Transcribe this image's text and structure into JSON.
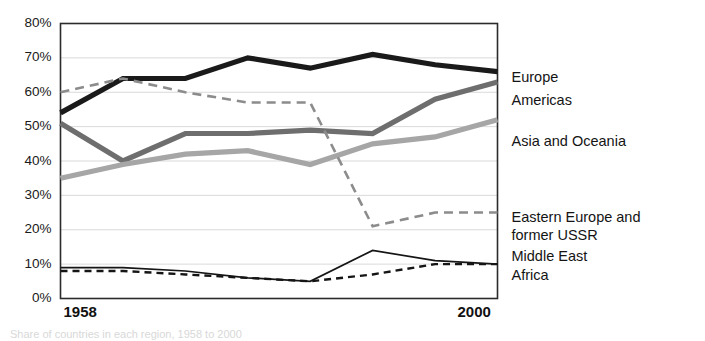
{
  "chart_data": {
    "type": "line",
    "title": "",
    "xlabel": "",
    "ylabel": "",
    "grid": true,
    "legend_position": "right",
    "ylim": [
      0,
      80
    ],
    "ytick_labels": [
      "80%",
      "70%",
      "60%",
      "50%",
      "40%",
      "30%",
      "20%",
      "10%",
      "0%"
    ],
    "ytick_values": [
      80,
      70,
      60,
      50,
      40,
      30,
      20,
      10,
      0
    ],
    "xtick_labels": [
      "1958",
      "2000"
    ],
    "x": [
      1958,
      1964,
      1970,
      1976,
      1982,
      1988,
      1994,
      2000
    ],
    "series": [
      {
        "name": "Europe",
        "color": "#1a1a1a",
        "width": 5.2,
        "dash": "none",
        "values": [
          54,
          64,
          64,
          70,
          67,
          71,
          68,
          66
        ]
      },
      {
        "name": "Americas",
        "color": "#6e6e6e",
        "width": 5.2,
        "dash": "none",
        "values": [
          51,
          40,
          48,
          48,
          49,
          48,
          58,
          63
        ]
      },
      {
        "name": "Asia and Oceania",
        "color": "#a6a6a6",
        "width": 5.2,
        "dash": "none",
        "values": [
          35,
          39,
          42,
          43,
          39,
          45,
          47,
          52
        ]
      },
      {
        "name": "Eastern Europe and former USSR",
        "color": "#8c8c8c",
        "width": 2.6,
        "dash": "9 6",
        "values": [
          60,
          64,
          60,
          57,
          57,
          21,
          25,
          25
        ]
      },
      {
        "name": "Middle East",
        "color": "#151515",
        "width": 1.7,
        "dash": "none",
        "values": [
          9,
          9,
          8,
          6,
          5,
          14,
          11,
          10
        ]
      },
      {
        "name": "Africa",
        "color": "#151515",
        "width": 2.4,
        "dash": "7 5",
        "values": [
          8,
          8,
          7,
          6,
          5,
          7,
          10,
          10
        ]
      }
    ],
    "legend_entries": [
      {
        "label": "Europe",
        "y": 64
      },
      {
        "label": "Americas",
        "y": 57.5
      },
      {
        "label": "Asia and Oceania",
        "y": 45.5
      },
      {
        "label": "Eastern Europe and",
        "y": 23.5
      },
      {
        "label": "former USSR",
        "y": 18.0
      },
      {
        "label": "Middle East",
        "y": 12.0
      },
      {
        "label": "Africa",
        "y": 6.5
      }
    ]
  },
  "caption": {
    "text": "Share of countries in each region, 1958 to 2000"
  }
}
